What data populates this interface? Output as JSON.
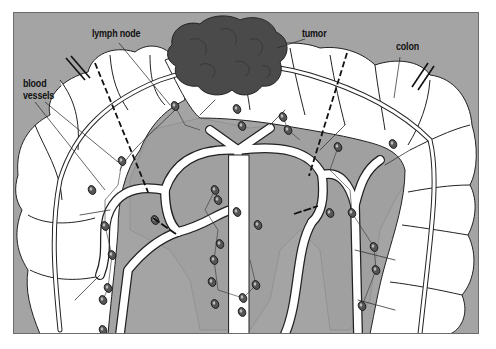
{
  "figure": {
    "background_color": "#ffffff",
    "panel_color": "#a4a4a4",
    "colon_fill": "#ffffff",
    "outline_color": "#222222",
    "tumor_color": "#4a4a4a",
    "node_color": "#555555"
  },
  "labels": {
    "lymph_node": "lymph node",
    "tumor": "tumor",
    "colon": "colon",
    "blood_vessels_line1": "blood",
    "blood_vessels_line2": "vessels"
  },
  "elements": {
    "tumor": {
      "cx": 232,
      "cy": 57
    },
    "resection_lines": [
      {
        "x1": 95,
        "y1": 63,
        "x2": 148,
        "y2": 192
      },
      {
        "x1": 347,
        "y1": 53,
        "x2": 309,
        "y2": 176
      },
      {
        "x1": 153,
        "y1": 218,
        "x2": 176,
        "y2": 234
      },
      {
        "x1": 294,
        "y1": 214,
        "x2": 318,
        "y2": 206
      }
    ],
    "lymph_nodes": [
      {
        "cx": 175,
        "cy": 106
      },
      {
        "cx": 237,
        "cy": 109
      },
      {
        "cx": 242,
        "cy": 126
      },
      {
        "cx": 283,
        "cy": 117
      },
      {
        "cx": 288,
        "cy": 130
      },
      {
        "cx": 338,
        "cy": 147
      },
      {
        "cx": 393,
        "cy": 144
      },
      {
        "cx": 122,
        "cy": 161
      },
      {
        "cx": 92,
        "cy": 190
      },
      {
        "cx": 105,
        "cy": 226
      },
      {
        "cx": 112,
        "cy": 255
      },
      {
        "cx": 108,
        "cy": 288
      },
      {
        "cx": 103,
        "cy": 300
      },
      {
        "cx": 103,
        "cy": 330
      },
      {
        "cx": 155,
        "cy": 220
      },
      {
        "cx": 215,
        "cy": 190
      },
      {
        "cx": 218,
        "cy": 200
      },
      {
        "cx": 237,
        "cy": 212
      },
      {
        "cx": 220,
        "cy": 244
      },
      {
        "cx": 214,
        "cy": 260
      },
      {
        "cx": 212,
        "cy": 282
      },
      {
        "cx": 215,
        "cy": 304
      },
      {
        "cx": 243,
        "cy": 298
      },
      {
        "cx": 256,
        "cy": 285
      },
      {
        "cx": 242,
        "cy": 312
      },
      {
        "cx": 258,
        "cy": 225
      },
      {
        "cx": 330,
        "cy": 213
      },
      {
        "cx": 352,
        "cy": 213
      },
      {
        "cx": 374,
        "cy": 247
      },
      {
        "cx": 376,
        "cy": 270
      },
      {
        "cx": 362,
        "cy": 306
      }
    ]
  }
}
